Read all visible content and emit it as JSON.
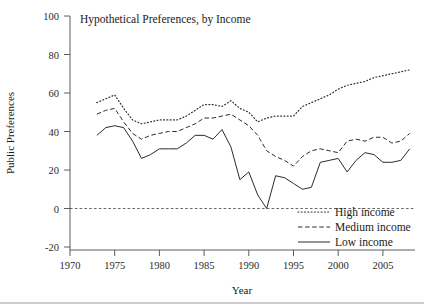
{
  "chart_data": {
    "type": "line",
    "title": "Hypothetical Preferences, by Income",
    "xlabel": "Year",
    "ylabel": "Public Preferences",
    "xlim": [
      1968,
      2009
    ],
    "ylim": [
      -20,
      100
    ],
    "grid": false,
    "legend_position": "bottom-right",
    "xticks": [
      1970,
      1975,
      1980,
      1985,
      1990,
      1995,
      2000,
      2005
    ],
    "yticks": [
      -20,
      0,
      20,
      40,
      60,
      80,
      100
    ],
    "zero_reference_line": 0,
    "x": [
      1973,
      1974,
      1975,
      1976,
      1977,
      1978,
      1979,
      1980,
      1981,
      1982,
      1983,
      1984,
      1985,
      1986,
      1987,
      1988,
      1989,
      1990,
      1991,
      1992,
      1993,
      1994,
      1995,
      1996,
      1997,
      1998,
      1999,
      2000,
      2001,
      2002,
      2003,
      2004,
      2005,
      2006,
      2007,
      2008
    ],
    "series": [
      {
        "name": "High income",
        "style": "dotted",
        "color": "#2b2b2b",
        "values": [
          55,
          57,
          59,
          52,
          46,
          44,
          45,
          46,
          46,
          46,
          48,
          51,
          54,
          54,
          53,
          56,
          52,
          50,
          45,
          47,
          48,
          48,
          48,
          53,
          55,
          57,
          59,
          62,
          64,
          65,
          66,
          68,
          69,
          70,
          71,
          72
        ]
      },
      {
        "name": "Medium income",
        "style": "dashed",
        "color": "#2b2b2b",
        "values": [
          49,
          51,
          52,
          45,
          39,
          36,
          38,
          39,
          40,
          40,
          42,
          44,
          47,
          47,
          48,
          49,
          46,
          43,
          38,
          30,
          27,
          25,
          22,
          27,
          30,
          31,
          30,
          29,
          35,
          36,
          35,
          37,
          37,
          34,
          35,
          39
        ],
        "values_note": "1989-1995 decline then recovery"
      },
      {
        "name": "Low income",
        "style": "solid",
        "color": "#2b2b2b",
        "values": [
          38,
          42,
          43,
          42,
          35,
          26,
          28,
          31,
          31,
          31,
          34,
          38,
          38,
          36,
          41,
          32,
          15,
          19,
          7,
          0,
          17,
          16,
          13,
          10,
          11,
          24,
          25,
          26,
          19,
          25,
          29,
          28,
          24,
          24,
          25,
          31
        ]
      }
    ]
  },
  "legend": {
    "entries": [
      {
        "label": "High income",
        "style": "dotted"
      },
      {
        "label": "Medium income",
        "style": "dashed"
      },
      {
        "label": "Low income",
        "style": "solid"
      }
    ]
  }
}
